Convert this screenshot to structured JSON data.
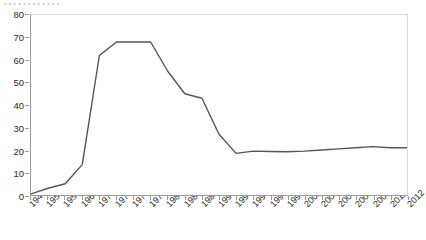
{
  "title_sliver": "• • • • • • • • • • • •",
  "colors": {
    "line": "#555555",
    "axis": "#9b9b9b",
    "frame": "#d7d7d7",
    "text": "#2b2b2b",
    "background": "#ffffff"
  },
  "chart_data": {
    "type": "line",
    "title": "",
    "xlabel": "",
    "ylabel": "",
    "ylim": [
      0,
      80
    ],
    "ytick_step": 10,
    "yticks": [
      0,
      10,
      20,
      30,
      40,
      50,
      60,
      70,
      80
    ],
    "grid": false,
    "legend": "none",
    "categories": [
      "1941",
      "1950",
      "1955",
      "1960",
      "1970",
      "1973",
      "1976",
      "1978",
      "1980",
      "1983",
      "1985",
      "1990",
      "1993",
      "1995",
      "1997",
      "1999",
      "2001",
      "2003",
      "2005",
      "2007",
      "2009",
      "2011",
      "2012"
    ],
    "series": [
      {
        "name": "series-1",
        "values": [
          0.5,
          3,
          5,
          13.5,
          62,
          68,
          68,
          68,
          55,
          45,
          43,
          27,
          18.5,
          19.5,
          19.3,
          19.2,
          19.5,
          20,
          20.5,
          21,
          21.5,
          21,
          21
        ]
      }
    ]
  }
}
